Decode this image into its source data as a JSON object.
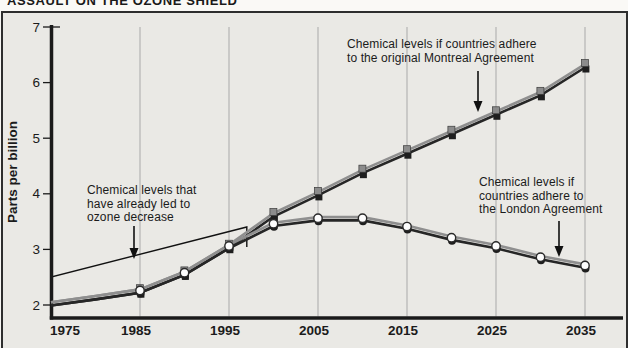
{
  "header": {
    "title_partial": "ASSAULT ON THE OZONE SHIELD"
  },
  "chart_data": {
    "type": "line",
    "ylabel": "Parts per billion",
    "xlabel": "",
    "x_ticks": [
      1975,
      1985,
      1995,
      2005,
      2015,
      2025,
      2035
    ],
    "y_ticks": [
      2,
      3,
      4,
      5,
      6,
      7
    ],
    "xlim": [
      1975,
      2040
    ],
    "ylim": [
      2,
      7
    ],
    "grid": "vertical-only",
    "x": [
      1975,
      1980,
      1985,
      1990,
      1995,
      2000,
      2005,
      2010,
      2015,
      2020,
      2025,
      2030,
      2035
    ],
    "marker_start_year": 1985,
    "series": [
      {
        "name": "Original Montreal Agreement",
        "marker": "square",
        "values": [
          2.02,
          2.13,
          2.25,
          2.57,
          3.05,
          3.62,
          4.0,
          4.4,
          4.75,
          5.1,
          5.45,
          5.8,
          6.3
        ]
      },
      {
        "name": "London Agreement",
        "marker": "circle",
        "values": [
          2.02,
          2.13,
          2.25,
          2.57,
          3.05,
          3.45,
          3.55,
          3.55,
          3.4,
          3.2,
          3.05,
          2.85,
          2.7
        ]
      }
    ],
    "bracket_range_years": [
      1975,
      1997
    ]
  },
  "annotations": {
    "montreal": {
      "lines": [
        "Chemical levels if countries adhere",
        "to the  original Montreal Agreement"
      ]
    },
    "london": {
      "lines": [
        "Chemical levels if",
        "countries adhere to",
        "the London Agreement"
      ]
    },
    "decrease": {
      "lines": [
        "Chemical levels that",
        "have already led to",
        "ozone decrease"
      ]
    }
  },
  "colors": {
    "background": "#eae9e5",
    "frame_border": "#2e2e2e",
    "grid": "#a9a9a9",
    "axis": "#1a1a1a",
    "line_dark": "#262626",
    "line_light": "#8f8f8f",
    "square_gray": "#8c8c8c",
    "square_dark": "#1e1e1e",
    "circle_white": "#fdfdfd",
    "text": "#1b1b1b"
  }
}
